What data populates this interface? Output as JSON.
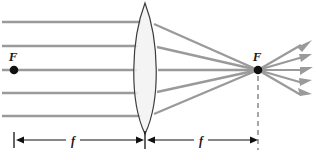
{
  "diagram": {
    "labels": {
      "focal_point_left": "F",
      "focal_point_right": "F",
      "focal_length_left": "f",
      "focal_length_right": "f"
    },
    "colors": {
      "ray": "#9a9a9a",
      "lens_outline": "#3c3c3c",
      "lens_fill": "#f2f2f2",
      "point": "#111111",
      "measure": "#111111",
      "dashed": "#6b6b6b",
      "background": "#ffffff"
    },
    "geometry": {
      "lens_center_x": 145,
      "lens_top_y": 3,
      "lens_bottom_y": 134,
      "lens_half_width": 16,
      "axis_y": 70,
      "focal_point_left_x": 14,
      "focal_point_right_x": 258,
      "incoming_ray_y": [
        22,
        46,
        70,
        93,
        116
      ],
      "measure_bar_y": 140,
      "measure_left_from_x": 14,
      "measure_left_to_x": 145,
      "measure_right_from_x": 145,
      "measure_right_to_x": 258,
      "label_f_left_x": 72,
      "label_f_right_x": 200,
      "diverging_ray_end_x": 310,
      "diverging_ray_end_y": [
        44,
        56,
        70,
        83,
        95
      ]
    }
  }
}
